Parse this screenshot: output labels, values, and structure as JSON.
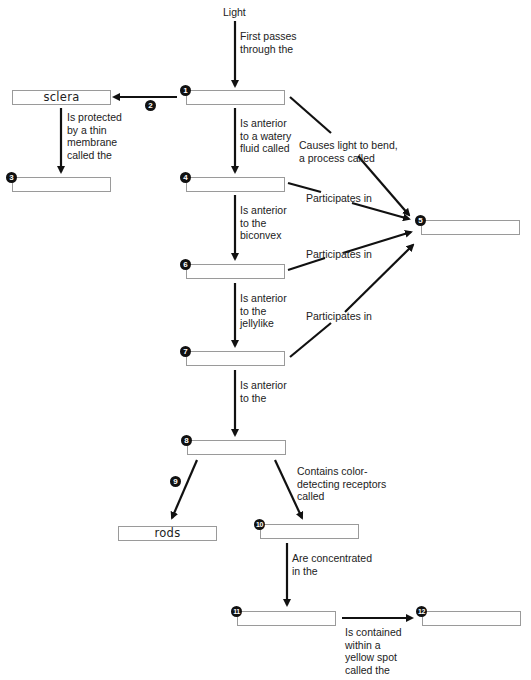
{
  "diagram": {
    "source_label": "Light",
    "nodes": [
      {
        "id": "1",
        "marker": "1",
        "value": ""
      },
      {
        "id": "sclera",
        "marker": "",
        "value": "sclera"
      },
      {
        "id": "3",
        "marker": "3",
        "value": ""
      },
      {
        "id": "4",
        "marker": "4",
        "value": ""
      },
      {
        "id": "5",
        "marker": "5",
        "value": ""
      },
      {
        "id": "6",
        "marker": "6",
        "value": ""
      },
      {
        "id": "7",
        "marker": "7",
        "value": ""
      },
      {
        "id": "8",
        "marker": "8",
        "value": ""
      },
      {
        "id": "rods",
        "marker": "",
        "value": "rods"
      },
      {
        "id": "10",
        "marker": "10",
        "value": ""
      },
      {
        "id": "11",
        "marker": "11",
        "value": ""
      },
      {
        "id": "12",
        "marker": "12",
        "value": ""
      }
    ],
    "edge_markers": {
      "two": "2",
      "nine": "9"
    },
    "edges": [
      {
        "from": "Light",
        "to": "1",
        "label": "First passes\nthrough the"
      },
      {
        "from": "1",
        "to": "sclera",
        "label": ""
      },
      {
        "from": "sclera",
        "to": "3",
        "label": "Is protected\nby a thin\nmembrane\ncalled the"
      },
      {
        "from": "1",
        "to": "4",
        "label": "Is anterior\nto a watery\nfluid called"
      },
      {
        "from": "1",
        "to": "5",
        "label": "Causes light to bend,\na process called"
      },
      {
        "from": "4",
        "to": "5",
        "label": "Participates in"
      },
      {
        "from": "4",
        "to": "6",
        "label": "Is anterior\nto the\nbiconvex"
      },
      {
        "from": "6",
        "to": "5",
        "label": "Participates in"
      },
      {
        "from": "6",
        "to": "7",
        "label": "Is anterior\nto the\njellylike"
      },
      {
        "from": "7",
        "to": "5",
        "label": "Participates in"
      },
      {
        "from": "7",
        "to": "8",
        "label": "Is anterior\nto the"
      },
      {
        "from": "8",
        "to": "rods",
        "label": ""
      },
      {
        "from": "8",
        "to": "10",
        "label": "Contains color-\ndetecting receptors\ncalled"
      },
      {
        "from": "10",
        "to": "11",
        "label": "Are concentrated\nin the"
      },
      {
        "from": "11",
        "to": "12",
        "label": "Is contained\nwithin a\nyellow spot\ncalled the"
      }
    ]
  }
}
